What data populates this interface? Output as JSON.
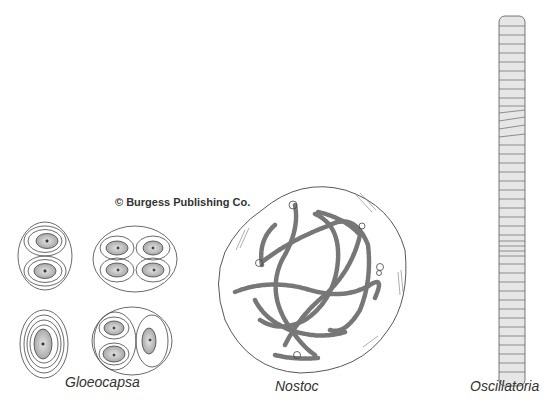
{
  "figure": {
    "copyright": "© Burgess Publishing Co.",
    "labels": {
      "gloeocapsa": "Gloeocapsa",
      "nostoc": "Nostoc",
      "oscillatoria": "Oscillatoria"
    },
    "colors": {
      "ink": "#333333",
      "cell_fill": "#cfcfcf",
      "background": "#ffffff"
    }
  }
}
